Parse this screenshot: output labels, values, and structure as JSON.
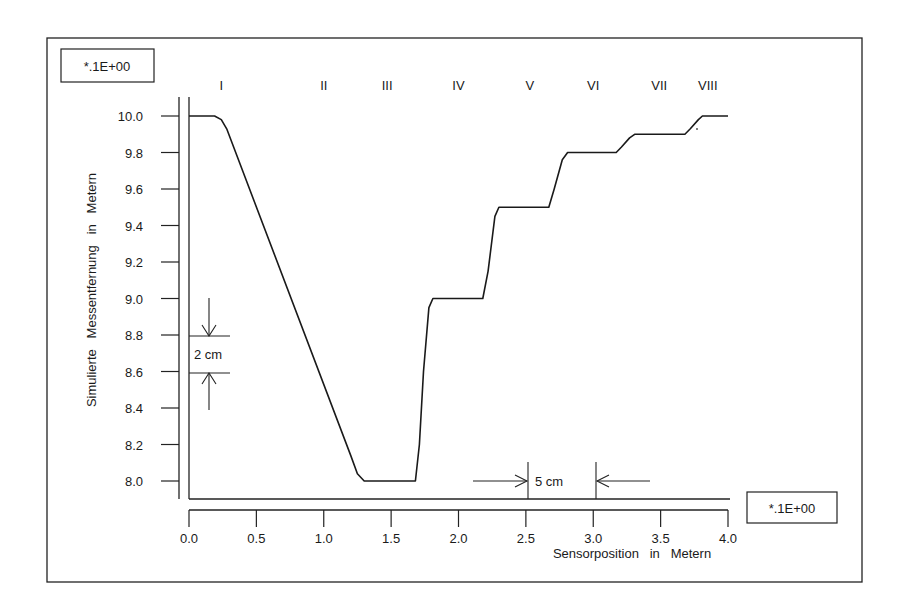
{
  "chart_data": {
    "type": "line",
    "title": "",
    "xlabel": "Sensorposition   in   Metern",
    "ylabel": "Simulierte   Messentfernung   in   Metern",
    "x_scale_label": "*.1E+00",
    "y_scale_label": "*.1E+00",
    "xlim": [
      0.0,
      4.0
    ],
    "ylim": [
      8.0,
      10.0
    ],
    "grid": false,
    "legend": null,
    "x_ticks": [
      "0.0",
      "0.5",
      "1.0",
      "1.5",
      "2.0",
      "2.5",
      "3.0",
      "3.5",
      "4.0"
    ],
    "y_ticks": [
      "10.0",
      "9.8",
      "9.6",
      "9.4",
      "9.2",
      "9.0",
      "8.8",
      "8.6",
      "8.4",
      "8.2",
      "8.0"
    ],
    "region_labels": [
      {
        "label": "I",
        "x": 0.24
      },
      {
        "label": "II",
        "x": 1.0
      },
      {
        "label": "III",
        "x": 1.47
      },
      {
        "label": "IV",
        "x": 2.0
      },
      {
        "label": "V",
        "x": 2.53
      },
      {
        "label": "VI",
        "x": 3.0
      },
      {
        "label": "VII",
        "x": 3.49
      },
      {
        "label": "VIII",
        "x": 3.85
      }
    ],
    "annotations": [
      {
        "text": "2 cm",
        "type": "vertical-dimension",
        "y_from": 8.6,
        "y_to": 8.8,
        "x": 0.15
      },
      {
        "text": "5 cm",
        "type": "horizontal-dimension",
        "x_from": 2.5,
        "x_to": 3.0,
        "y": 8.0
      }
    ],
    "series": [
      {
        "name": "Simulierte Messentfernung",
        "x": [
          0.0,
          0.19,
          0.24,
          0.28,
          1.2,
          1.25,
          1.3,
          1.68,
          1.71,
          1.74,
          1.78,
          1.81,
          2.18,
          2.22,
          2.27,
          2.3,
          2.67,
          2.71,
          2.77,
          2.81,
          3.17,
          3.21,
          3.27,
          3.31,
          3.68,
          3.72,
          3.78,
          3.81,
          4.0
        ],
        "values": [
          10.0,
          10.0,
          9.98,
          9.93,
          8.14,
          8.04,
          8.0,
          8.0,
          8.2,
          8.6,
          8.95,
          9.0,
          9.0,
          9.15,
          9.45,
          9.5,
          9.5,
          9.6,
          9.76,
          9.8,
          9.8,
          9.83,
          9.88,
          9.9,
          9.9,
          9.93,
          9.98,
          10.0,
          10.0
        ]
      }
    ]
  }
}
